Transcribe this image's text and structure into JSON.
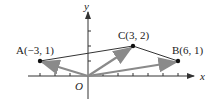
{
  "diagram": {
    "axes": {
      "x_label": "x",
      "y_label": "y",
      "origin_label": "O"
    },
    "points": [
      {
        "id": "A",
        "label": "A(−3, 1)",
        "x": -3,
        "y": 1
      },
      {
        "id": "C",
        "label": "C(3, 2)",
        "x": 3,
        "y": 2
      },
      {
        "id": "B",
        "label": "B(6, 1)",
        "x": 6,
        "y": 1
      }
    ],
    "vectors": [
      "OA",
      "OC",
      "OB"
    ],
    "segments": [
      "AC",
      "CB"
    ],
    "colors": {
      "axis": "#333333",
      "vector": "#8a8a8a",
      "segment": "#333333",
      "point": "#111111"
    }
  }
}
